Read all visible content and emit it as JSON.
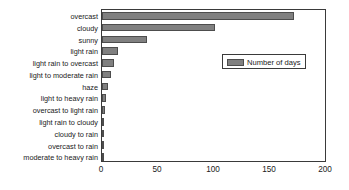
{
  "chart_data": {
    "type": "bar",
    "orientation": "horizontal",
    "title": "",
    "xlabel": "",
    "ylabel": "",
    "xlim": [
      0,
      200
    ],
    "xticks": [
      0,
      50,
      100,
      150,
      200
    ],
    "grid": false,
    "legend": {
      "position": "upper-right-inside",
      "entries": [
        {
          "name": "Number of days",
          "color": "#808080"
        }
      ]
    },
    "series": [
      {
        "name": "Number of days",
        "color": "#808080",
        "values": [
          172,
          101,
          40,
          14,
          11,
          8,
          5,
          4,
          3,
          2,
          1,
          1,
          1
        ]
      }
    ],
    "categories": [
      "overcast",
      "cloudy",
      "sunny",
      "light rain",
      "light rain to overcast",
      "light to moderate rain",
      "haze",
      "light to heavy rain",
      "overcast to light rain",
      "light rain to cloudy",
      "cloudy to rain",
      "overcast to rain",
      "moderate to heavy rain"
    ]
  },
  "colors": {
    "bar_fill": "#808080",
    "bar_edge": "#4d4d4d",
    "axis": "#3a3a3a",
    "text": "#1a1a1a",
    "background": "#ffffff"
  }
}
